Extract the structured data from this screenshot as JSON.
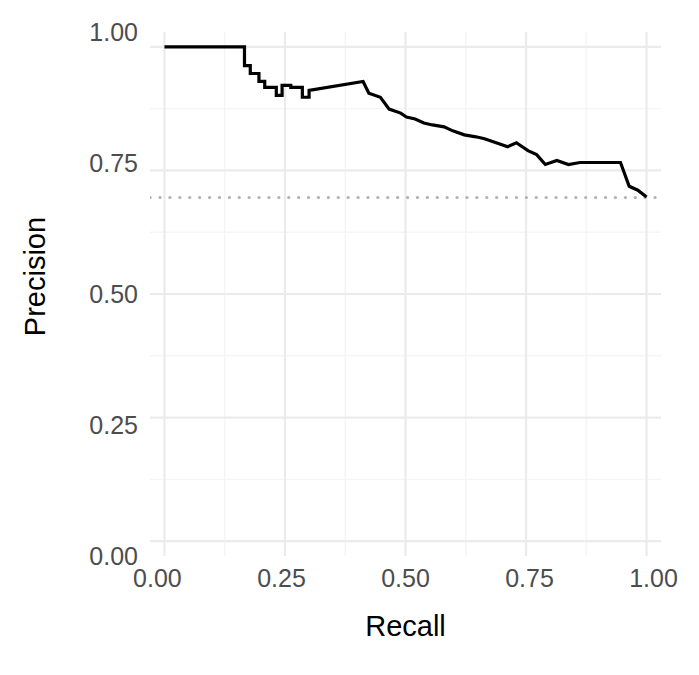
{
  "chart_data": {
    "type": "line",
    "title": "",
    "xlabel": "Recall",
    "ylabel": "Precision",
    "xlim": [
      -0.03,
      1.03
    ],
    "ylim": [
      -0.03,
      1.03
    ],
    "grid": true,
    "legend": false,
    "x_ticks": [
      0.0,
      0.25,
      0.5,
      0.75,
      1.0
    ],
    "x_tick_labels": [
      "0.00",
      "0.25",
      "0.50",
      "0.75",
      "1.00"
    ],
    "y_ticks": [
      0.0,
      0.25,
      0.5,
      0.75,
      1.0
    ],
    "y_tick_labels": [
      "0.00",
      "0.25",
      "0.50",
      "0.75",
      "1.00"
    ],
    "minor_gridlines": [
      0.125,
      0.375,
      0.625,
      0.875
    ],
    "series": [
      {
        "name": "precision-recall-curve",
        "style": "step-solid",
        "color": "#000000",
        "width": 3.2,
        "x": [
          0.0,
          0.166,
          0.166,
          0.178,
          0.178,
          0.196,
          0.196,
          0.208,
          0.208,
          0.232,
          0.232,
          0.244,
          0.244,
          0.262,
          0.262,
          0.286,
          0.286,
          0.3,
          0.3,
          0.412,
          0.412,
          0.424,
          0.424,
          0.448,
          0.448,
          0.466,
          0.466,
          0.49,
          0.49,
          0.502,
          0.502,
          0.52,
          0.52,
          0.538,
          0.538,
          0.556,
          0.556,
          0.58,
          0.58,
          0.598,
          0.598,
          0.622,
          0.622,
          0.646,
          0.646,
          0.664,
          0.664,
          0.688,
          0.688,
          0.712,
          0.712,
          0.73,
          0.73,
          0.754,
          0.754,
          0.772,
          0.772,
          0.79,
          0.79,
          0.814,
          0.814,
          0.838,
          0.838,
          0.862,
          0.862,
          0.946,
          0.946,
          0.964,
          0.964,
          0.982,
          0.982,
          1.0
        ],
        "y": [
          1.0,
          1.0,
          0.962,
          0.962,
          0.946,
          0.946,
          0.93,
          0.93,
          0.918,
          0.918,
          0.902,
          0.902,
          0.922,
          0.922,
          0.918,
          0.918,
          0.898,
          0.898,
          0.912,
          0.93,
          0.93,
          0.906,
          0.906,
          0.898,
          0.898,
          0.874,
          0.874,
          0.866,
          0.866,
          0.858,
          0.858,
          0.854,
          0.854,
          0.846,
          0.846,
          0.842,
          0.842,
          0.838,
          0.838,
          0.83,
          0.83,
          0.822,
          0.822,
          0.818,
          0.818,
          0.814,
          0.814,
          0.806,
          0.806,
          0.798,
          0.798,
          0.806,
          0.806,
          0.79,
          0.79,
          0.782,
          0.782,
          0.762,
          0.762,
          0.77,
          0.77,
          0.762,
          0.762,
          0.766,
          0.766,
          0.766,
          0.766,
          0.718,
          0.718,
          0.71,
          0.71,
          0.696
        ]
      }
    ],
    "reference_lines": [
      {
        "name": "baseline-prevalence",
        "orientation": "horizontal",
        "value": 0.695,
        "style": "dotted",
        "color": "#b3b3b3",
        "width": 3
      }
    ],
    "colors": {
      "curve": "#000000",
      "baseline": "#b3b3b3",
      "grid_major": "#ebebeb",
      "grid_minor": "#f5f5f5",
      "panel_background": "#ffffff",
      "tick_label": "#4d4d4d",
      "axis_title": "#000000"
    }
  },
  "axes": {
    "x": {
      "title": "Recall",
      "tick_labels": [
        "0.00",
        "0.25",
        "0.50",
        "0.75",
        "1.00"
      ]
    },
    "y": {
      "title": "Precision",
      "tick_labels": [
        "0.00",
        "0.25",
        "0.50",
        "0.75",
        "1.00"
      ]
    }
  }
}
